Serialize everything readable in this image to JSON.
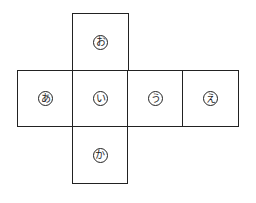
{
  "diagram": {
    "type": "cube-net",
    "faces": [
      {
        "id": "o",
        "label": "お",
        "col": 1,
        "row": 0
      },
      {
        "id": "a",
        "label": "あ",
        "col": 0,
        "row": 1
      },
      {
        "id": "i",
        "label": "い",
        "col": 1,
        "row": 1
      },
      {
        "id": "u",
        "label": "う",
        "col": 2,
        "row": 1
      },
      {
        "id": "e",
        "label": "え",
        "col": 3,
        "row": 1
      },
      {
        "id": "ka",
        "label": "か",
        "col": 1,
        "row": 2
      }
    ]
  }
}
